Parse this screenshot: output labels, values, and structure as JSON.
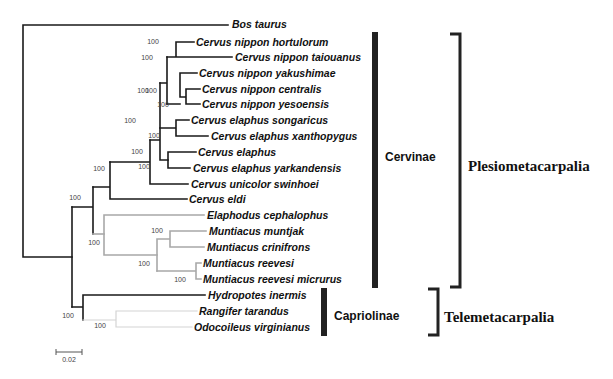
{
  "figure": {
    "type": "phylogenetic-tree",
    "scale_bar": {
      "label": "0.02",
      "x1": 56,
      "x2": 82,
      "y": 352
    }
  },
  "colors": {
    "black_branch": "#1a1a1a",
    "gray_branch": "#a8a8a8",
    "light_branch": "#d4d4d4",
    "bar": "#222222"
  },
  "taxa": [
    {
      "name": "Bos taurus",
      "x": 232,
      "y": 24
    },
    {
      "name": "Cervus nippon hortulorum",
      "x": 196,
      "y": 42
    },
    {
      "name": "Cervus nippon taiouanus",
      "x": 235,
      "y": 57
    },
    {
      "name": "Cervus nippon yakushimae",
      "x": 199,
      "y": 73
    },
    {
      "name": "Cervus nippon centralis",
      "x": 202,
      "y": 89
    },
    {
      "name": "Cervus nippon yesoensis",
      "x": 202,
      "y": 104
    },
    {
      "name": "Cervus elaphus songaricus",
      "x": 191,
      "y": 120
    },
    {
      "name": "Cervus elaphus xanthopygus",
      "x": 211,
      "y": 136
    },
    {
      "name": "Cervus elaphus",
      "x": 198,
      "y": 152
    },
    {
      "name": "Cervus elaphus yarkandensis",
      "x": 193,
      "y": 168
    },
    {
      "name": "Cervus unicolor swinhoei",
      "x": 191,
      "y": 184
    },
    {
      "name": "Cervus eldi",
      "x": 189,
      "y": 199
    },
    {
      "name": "Elaphodus cephalophus",
      "x": 207,
      "y": 215
    },
    {
      "name": "Muntiacus muntjak",
      "x": 209,
      "y": 231
    },
    {
      "name": "Muntiacus crinifrons",
      "x": 207,
      "y": 247
    },
    {
      "name": "Muntiacus reevesi",
      "x": 203,
      "y": 263
    },
    {
      "name": "Muntiacus reevesi micrurus",
      "x": 203,
      "y": 279
    },
    {
      "name": "Hydropotes inermis",
      "x": 208,
      "y": 295
    },
    {
      "name": "Rangifer tarandus",
      "x": 199,
      "y": 311
    },
    {
      "name": "Odocoileus virginianus",
      "x": 194,
      "y": 327
    }
  ],
  "branches": [
    {
      "d": "M23 25 H228 M23 25 V257 H72",
      "color": "black"
    },
    {
      "d": "M72 207 V307",
      "color": "black"
    },
    {
      "d": "M72 207 H93 M93 187 V234",
      "color": "black"
    },
    {
      "d": "M93 187 H110 M110 162 V199 H187",
      "color": "black"
    },
    {
      "d": "M110 162 H150 M150 140 V184 H188",
      "color": "black"
    },
    {
      "d": "M150 140 H160 M160 83 V160 H168",
      "color": "black"
    },
    {
      "d": "M168 152 V168 M168 152 H196 M168 168 H190",
      "color": "black"
    },
    {
      "d": "M160 83 H167 M167 57 V104",
      "color": "black"
    },
    {
      "d": "M167 57 H176 M176 42 V57 M176 42 H194 M176 57 H232",
      "color": "black"
    },
    {
      "d": "M167 104 H180 M180 73 V97 M180 73 H197 M180 97 H186 M186 89 V104 M186 89 H200 M186 104 H200",
      "color": "black"
    },
    {
      "d": "M160 128 H176 M176 120 V136 M176 120 H189 M176 136 H208",
      "color": "black"
    },
    {
      "d": "M93 234 H104",
      "color": "gray"
    },
    {
      "d": "M104 215 V255 M104 215 H204 M104 255 H157",
      "color": "gray"
    },
    {
      "d": "M157 239 V271 M157 239 H170 M170 231 V247 M170 231 H206 M170 247 H204",
      "color": "gray"
    },
    {
      "d": "M157 271 H196 M196 263 V279 M196 263 H201 M196 279 H201",
      "color": "gray"
    },
    {
      "d": "M72 307 H83 M83 295 V320 M83 295 H205",
      "color": "black"
    },
    {
      "d": "M83 320 H116 M116 311 V327 M116 311 H197 M116 327 H192",
      "color": "light"
    }
  ],
  "support_values": [
    {
      "label": "100",
      "x": 153,
      "y": 44
    },
    {
      "label": "100",
      "x": 147,
      "y": 60
    },
    {
      "label": "100",
      "x": 143,
      "y": 93
    },
    {
      "label": "100",
      "x": 151,
      "y": 93
    },
    {
      "label": "100",
      "x": 163,
      "y": 107
    },
    {
      "label": "100",
      "x": 130,
      "y": 123
    },
    {
      "label": "100",
      "x": 154,
      "y": 138
    },
    {
      "label": "100",
      "x": 137,
      "y": 154
    },
    {
      "label": "100",
      "x": 144,
      "y": 169
    },
    {
      "label": "100",
      "x": 99,
      "y": 171
    },
    {
      "label": "100",
      "x": 75,
      "y": 200
    },
    {
      "label": "100",
      "x": 157,
      "y": 233
    },
    {
      "label": "100",
      "x": 94,
      "y": 245
    },
    {
      "label": "100",
      "x": 144,
      "y": 266
    },
    {
      "label": "100",
      "x": 180,
      "y": 282
    },
    {
      "label": "100",
      "x": 68,
      "y": 318
    },
    {
      "label": "100",
      "x": 100,
      "y": 328
    }
  ],
  "clades": [
    {
      "name": "Cervinae",
      "bar_x": 375,
      "bar_y1": 32,
      "bar_y2": 288,
      "label_x": 385,
      "label_y": 157
    },
    {
      "name": "Capriolinae",
      "bar_x": 324,
      "bar_y1": 288,
      "bar_y2": 336,
      "label_x": 334,
      "label_y": 316
    }
  ],
  "groups": [
    {
      "name": "Plesiometacarpalia",
      "x": 460,
      "y1": 34,
      "y2": 287,
      "label_x": 468,
      "label_y": 166
    },
    {
      "name": "Telemetacarpalia",
      "x": 438,
      "y1": 289,
      "y2": 335,
      "label_x": 444,
      "label_y": 317
    }
  ]
}
